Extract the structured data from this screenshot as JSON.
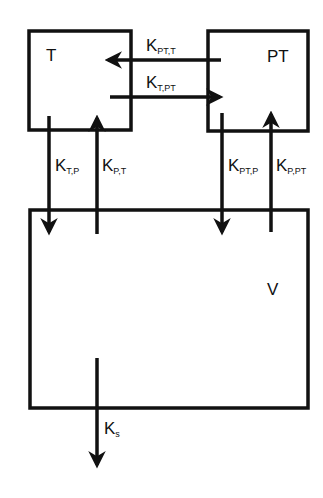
{
  "diagram": {
    "type": "compartmental-model",
    "compartments": [
      {
        "id": "T",
        "label": "T"
      },
      {
        "id": "PT",
        "label": "PT"
      },
      {
        "id": "V",
        "label": "V"
      }
    ],
    "flows": [
      {
        "id": "k_pt_t",
        "from": "PT",
        "to": "T",
        "symbol": "K",
        "subscript": "PT,T"
      },
      {
        "id": "k_t_pt",
        "from": "T",
        "to": "PT",
        "symbol": "K",
        "subscript": "T,PT"
      },
      {
        "id": "k_t_p",
        "from": "T",
        "to": "V",
        "symbol": "K",
        "subscript": "T,P"
      },
      {
        "id": "k_p_t",
        "from": "V",
        "to": "T",
        "symbol": "K",
        "subscript": "P,T"
      },
      {
        "id": "k_pt_p",
        "from": "PT",
        "to": "V",
        "symbol": "K",
        "subscript": "PT,P"
      },
      {
        "id": "k_p_pt",
        "from": "V",
        "to": "PT",
        "symbol": "K",
        "subscript": "P,PT"
      },
      {
        "id": "k_s",
        "from": "V",
        "to": "out",
        "symbol": "K",
        "subscript": "s"
      }
    ],
    "colors": {
      "stroke": "#111111",
      "background": "#ffffff"
    }
  }
}
